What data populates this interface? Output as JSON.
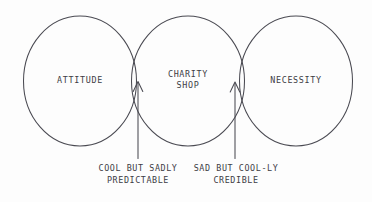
{
  "diagram": {
    "type": "venn",
    "title": "",
    "background_color": "#fdfdfd",
    "stroke_color": "#4a4a52",
    "text_color": "#3c3c44",
    "sets": [
      {
        "id": "attitude",
        "label": "ATTITUDE",
        "position": "left"
      },
      {
        "id": "charity-shop",
        "label_line_1": "CHARITY",
        "label_line_2": "SHOP",
        "position": "center"
      },
      {
        "id": "necessity",
        "label": "NECESSITY",
        "position": "right"
      }
    ],
    "annotations": [
      {
        "id": "left-overlap",
        "target": "attitude-charity-shop-overlap",
        "line_1": "COOL BUT SADLY",
        "line_2": "PREDICTABLE",
        "pointer": "arrow-up-icon"
      },
      {
        "id": "right-overlap",
        "target": "charity-shop-necessity-overlap",
        "line_1": "SAD BUT COOL-LY",
        "line_2": "CREDIBLE",
        "pointer": "arrow-up-icon"
      }
    ]
  }
}
